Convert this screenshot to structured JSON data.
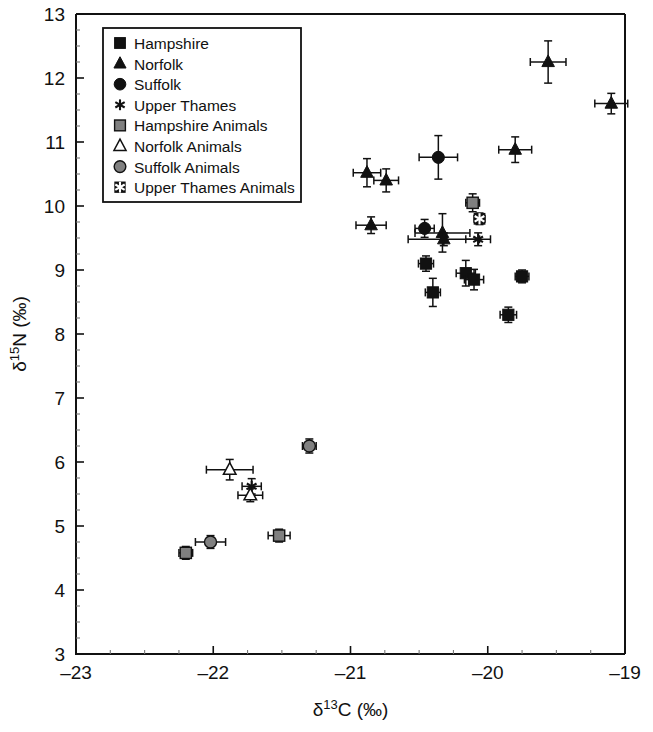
{
  "chart_data": {
    "type": "scatter",
    "title": "",
    "xlabel": "δ¹³C (‰)",
    "ylabel": "δ¹⁵N (‰)",
    "xlabel_parts": {
      "delta": "δ",
      "sup": "13",
      "element": "C (‰)"
    },
    "ylabel_parts": {
      "delta": "δ",
      "sup": "15",
      "element": "N (‰)"
    },
    "xlim": [
      -23,
      -19
    ],
    "ylim": [
      3,
      13
    ],
    "xticks": [
      -23,
      -22,
      -21,
      -20,
      -19
    ],
    "xtick_labels": [
      "–23",
      "–22",
      "–21",
      "–20",
      "–19"
    ],
    "yticks": [
      3,
      4,
      5,
      6,
      7,
      8,
      9,
      10,
      11,
      12,
      13
    ],
    "ytick_labels": [
      "3",
      "4",
      "5",
      "6",
      "7",
      "8",
      "9",
      "10",
      "11",
      "12",
      "13"
    ],
    "x_minor_interval": 0.25,
    "y_minor_interval": 0.25,
    "grid": false,
    "legend_position": "top-left",
    "error_bars": "x and y",
    "series": [
      {
        "name": "Hampshire",
        "marker": "square",
        "fill": "#111111",
        "points": [
          {
            "x": -20.45,
            "y": 9.1,
            "xerr": 0.055,
            "yerr": 0.12
          },
          {
            "x": -20.4,
            "y": 8.65,
            "xerr": 0.055,
            "yerr": 0.22
          },
          {
            "x": -20.16,
            "y": 8.95,
            "xerr": 0.07,
            "yerr": 0.2
          },
          {
            "x": -20.1,
            "y": 8.85,
            "xerr": 0.07,
            "yerr": 0.16
          },
          {
            "x": -19.85,
            "y": 8.3,
            "xerr": 0.06,
            "yerr": 0.12
          },
          {
            "x": -19.75,
            "y": 8.9,
            "xerr": 0.05,
            "yerr": 0.1
          }
        ]
      },
      {
        "name": "Norfolk",
        "marker": "triangle",
        "fill": "#111111",
        "points": [
          {
            "x": -20.88,
            "y": 10.52,
            "xerr": 0.1,
            "yerr": 0.22
          },
          {
            "x": -20.74,
            "y": 10.4,
            "xerr": 0.09,
            "yerr": 0.18
          },
          {
            "x": -20.85,
            "y": 9.7,
            "xerr": 0.11,
            "yerr": 0.13
          },
          {
            "x": -20.33,
            "y": 9.58,
            "xerr": 0.2,
            "yerr": 0.3
          },
          {
            "x": -20.32,
            "y": 9.48,
            "xerr": 0.26,
            "yerr": 0.1
          },
          {
            "x": -19.8,
            "y": 10.88,
            "xerr": 0.12,
            "yerr": 0.2
          },
          {
            "x": -19.56,
            "y": 12.25,
            "xerr": 0.13,
            "yerr": 0.33
          },
          {
            "x": -19.1,
            "y": 11.6,
            "xerr": 0.12,
            "yerr": 0.16
          }
        ]
      },
      {
        "name": "Suffolk",
        "marker": "circle",
        "fill": "#111111",
        "points": [
          {
            "x": -20.36,
            "y": 10.76,
            "xerr": 0.14,
            "yerr": 0.34
          },
          {
            "x": -20.46,
            "y": 9.65,
            "xerr": 0.07,
            "yerr": 0.14
          }
        ]
      },
      {
        "name": "Upper Thames",
        "marker": "asterisk",
        "fill": "#111111",
        "points": [
          {
            "x": -21.72,
            "y": 5.62,
            "xerr": 0.07,
            "yerr": 0.12
          },
          {
            "x": -20.07,
            "y": 9.48,
            "xerr": 0.09,
            "yerr": 0.1
          }
        ]
      },
      {
        "name": "Hampshire Animals",
        "marker": "square",
        "fill": "#808080",
        "points": [
          {
            "x": -22.2,
            "y": 4.58,
            "xerr": 0.05,
            "yerr": 0.1
          },
          {
            "x": -21.52,
            "y": 4.85,
            "xerr": 0.08,
            "yerr": 0.1
          },
          {
            "x": -20.11,
            "y": 10.05,
            "xerr": 0.05,
            "yerr": 0.14
          }
        ]
      },
      {
        "name": "Norfolk Animals",
        "marker": "triangle",
        "fill": "#ffffff",
        "points": [
          {
            "x": -21.88,
            "y": 5.88,
            "xerr": 0.17,
            "yerr": 0.16
          },
          {
            "x": -21.73,
            "y": 5.48,
            "xerr": 0.09,
            "yerr": 0.1
          }
        ]
      },
      {
        "name": "Suffolk Animals",
        "marker": "circle",
        "fill": "#808080",
        "points": [
          {
            "x": -22.02,
            "y": 4.75,
            "xerr": 0.11,
            "yerr": 0.1
          },
          {
            "x": -21.3,
            "y": 6.25,
            "xerr": 0.05,
            "yerr": 0.11
          }
        ]
      },
      {
        "name": "Upper Thames Animals",
        "marker": "asterisk-box",
        "fill": "#111111",
        "points": [
          {
            "x": -20.06,
            "y": 9.8,
            "xerr": 0.04,
            "yerr": 0.09
          }
        ]
      }
    ],
    "legend": [
      {
        "label": "Hampshire",
        "marker": "square",
        "fill": "#111111"
      },
      {
        "label": "Norfolk",
        "marker": "triangle",
        "fill": "#111111"
      },
      {
        "label": "Suffolk",
        "marker": "circle",
        "fill": "#111111"
      },
      {
        "label": "Upper Thames",
        "marker": "asterisk",
        "fill": "#111111"
      },
      {
        "label": "Hampshire Animals",
        "marker": "square",
        "fill": "#808080"
      },
      {
        "label": "Norfolk Animals",
        "marker": "triangle",
        "fill": "#ffffff"
      },
      {
        "label": "Suffolk Animals",
        "marker": "circle",
        "fill": "#808080"
      },
      {
        "label": "Upper Thames Animals",
        "marker": "asterisk-box",
        "fill": "#111111"
      }
    ]
  },
  "colors": {
    "background": "#ffffff",
    "axis": "#111111",
    "marker_dark": "#111111",
    "marker_gray": "#808080",
    "marker_open": "#ffffff"
  }
}
